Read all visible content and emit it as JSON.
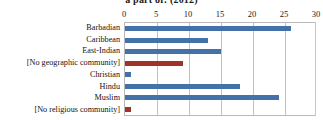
{
  "chart_data": {
    "type": "bar",
    "orientation": "horizontal",
    "title": "a part of: (2012)",
    "xlabel": "",
    "ylabel": "",
    "xlim": [
      0,
      30
    ],
    "grid": true,
    "legend": "none",
    "xticks": [
      "0",
      "5",
      "10",
      "15",
      "20",
      "25",
      "30"
    ],
    "categories": [
      "Barbadian",
      "Caribbean",
      "East-Indian",
      "[No geographic community]",
      "Christian",
      "Hindu",
      "Muslim",
      "[No religious community]"
    ],
    "values": [
      26,
      13,
      15,
      9,
      1,
      18,
      24,
      1
    ],
    "bar_colors": [
      "#4472a8",
      "#4472a8",
      "#4472a8",
      "#a03228",
      "#4472a8",
      "#4472a8",
      "#4472a8",
      "#a03228"
    ],
    "colors": {
      "series_blue": "#4472a8",
      "series_red": "#a03228",
      "gridline": "#c2c2c2",
      "axis_border": "#b9b9b9",
      "text": "#131313",
      "background": "#ffffff"
    }
  }
}
